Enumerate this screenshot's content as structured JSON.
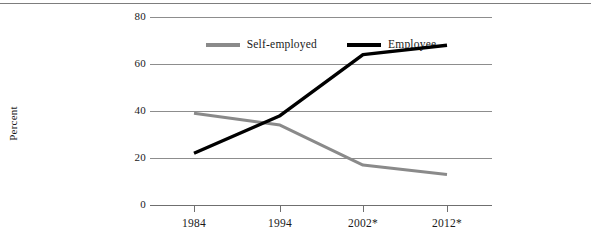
{
  "chart_data": {
    "type": "line",
    "title": "",
    "xlabel": "",
    "ylabel": "Percent",
    "categories": [
      "1984",
      "1994",
      "2002*",
      "2012*"
    ],
    "ylim": [
      0,
      80
    ],
    "yticks": [
      0,
      20,
      40,
      60,
      80
    ],
    "grid": true,
    "legend_position": "top-center",
    "series": [
      {
        "name": "Self-employed",
        "color": "#8a8a8a",
        "values": [
          39,
          34,
          17,
          13
        ]
      },
      {
        "name": "Employee",
        "color": "#000000",
        "values": [
          22,
          38,
          64,
          68
        ]
      }
    ]
  },
  "axis": {
    "y_tick_labels": [
      "0",
      "20",
      "40",
      "60",
      "80"
    ],
    "x_tick_labels": [
      "1984",
      "1994",
      "2002*",
      "2012*"
    ],
    "y_axis_title": "Percent"
  },
  "legend": {
    "items": [
      {
        "label": "Self-employed",
        "color": "#8a8a8a"
      },
      {
        "label": "Employee",
        "color": "#000000"
      }
    ]
  },
  "style": {
    "background": "#ffffff",
    "gridline_color": "#8d8d8d",
    "border_color": "#7d7d7d",
    "text_color": "#1a1a1a"
  }
}
